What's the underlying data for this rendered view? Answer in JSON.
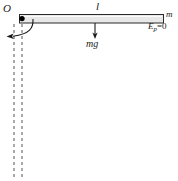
{
  "figure": {
    "background_color": "#ffffff",
    "width": 178,
    "height": 181
  },
  "labels": {
    "pivot": "O",
    "length": "l",
    "mass": "m",
    "potential_energy_ref_symbol": "E",
    "potential_energy_ref_subscript": "p",
    "potential_energy_ref_value": "=0",
    "weight": "mg"
  },
  "rod": {
    "fill_color": "#e8e8e8",
    "stroke_color": "#2b2b2b",
    "x": 19,
    "y": 14,
    "width": 145,
    "height": 9
  },
  "pivot_dot": {
    "color": "#000000",
    "cx": 22,
    "cy": 18,
    "r": 2.6
  },
  "weight_arrow": {
    "color": "#1a1a1a",
    "x": 95,
    "y_start": 23,
    "y_end": 38
  },
  "rotation_arrow": {
    "color": "#1a1a1a",
    "description": "curved arrow from rod near pivot sweeping down and left"
  },
  "dashed_lines": {
    "color": "#555555",
    "dash_pattern": "3 3",
    "line1_x": 14,
    "line2_x": 22,
    "y_start": 24,
    "y_end": 178
  }
}
